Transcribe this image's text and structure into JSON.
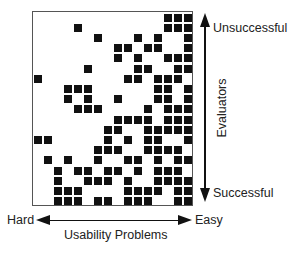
{
  "diagram": {
    "type": "binary-matrix",
    "rows": 19,
    "cols": 16,
    "colors": {
      "filled": "#111111",
      "empty": "#ffffff",
      "border": "#555555"
    },
    "filled_cells_by_row": [
      [
        13,
        14,
        15
      ],
      [
        4,
        13,
        14,
        15
      ],
      [
        6,
        10,
        12,
        15
      ],
      [
        8,
        9,
        11,
        12,
        15
      ],
      [
        8,
        10,
        13,
        14,
        15
      ],
      [
        5,
        10,
        11,
        14,
        15
      ],
      [
        0,
        9,
        10,
        12,
        13,
        14
      ],
      [
        3,
        4,
        5,
        12,
        13,
        15
      ],
      [
        3,
        5,
        8,
        12,
        13,
        15
      ],
      [
        4,
        5,
        6,
        11,
        13,
        14,
        15
      ],
      [
        8,
        9,
        10,
        11,
        13,
        14,
        15
      ],
      [
        7,
        8,
        11,
        12,
        13,
        14,
        15
      ],
      [
        0,
        1,
        7,
        9,
        11,
        12,
        15
      ],
      [
        6,
        7,
        8,
        11,
        12,
        13,
        14
      ],
      [
        1,
        3,
        6,
        9,
        10,
        12,
        14,
        15
      ],
      [
        2,
        4,
        5,
        7,
        8,
        10,
        12,
        13,
        14
      ],
      [
        2,
        5,
        6,
        7,
        9,
        12,
        13,
        14,
        15
      ],
      [
        2,
        3,
        4,
        9,
        10,
        11,
        12,
        14,
        15
      ],
      [
        2,
        3,
        4,
        6,
        7,
        9,
        10,
        11,
        14,
        15
      ]
    ]
  },
  "axes": {
    "vertical": {
      "label": "Evaluators",
      "top_label": "Unsuccessful",
      "bottom_label": "Successful"
    },
    "horizontal": {
      "label": "Usability Problems",
      "left_label": "Hard",
      "right_label": "Easy"
    }
  }
}
